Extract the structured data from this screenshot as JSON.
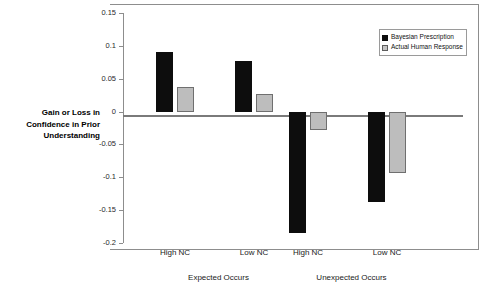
{
  "chart_data": {
    "type": "bar",
    "title": "",
    "subtitle": "",
    "xlabel": "",
    "ylabel": "Gain or Loss in Confidence in Prior Understanding",
    "ylim": [
      -0.2,
      0.15
    ],
    "ytick_labels": [
      "0.15",
      "0.1",
      "0.05",
      "0",
      "-0.05",
      "-0.1",
      "-0.15",
      "-0.2"
    ],
    "ytick_values": [
      0.15,
      0.1,
      0.05,
      0,
      -0.05,
      -0.1,
      -0.15,
      -0.2
    ],
    "grid": false,
    "legend_position": "top-right",
    "categories": [
      "High NC",
      "Low NC",
      "High NC",
      "Low NC"
    ],
    "group_labels": [
      "Expected Occurs",
      "Unexpected Occurs"
    ],
    "groups": [
      {
        "label": "Expected Occurs",
        "categories": [
          "High NC",
          "Low NC"
        ]
      },
      {
        "label": "Unexpected Occurs",
        "categories": [
          "High NC",
          "Low NC"
        ]
      }
    ],
    "series": [
      {
        "name": "Bayesian Prescription",
        "color": "#0d0d0d",
        "values": [
          0.09,
          0.077,
          -0.185,
          -0.137
        ]
      },
      {
        "name": "Actual Human Response",
        "color": "#bdbdbd",
        "values": [
          0.038,
          0.027,
          -0.028,
          -0.093
        ]
      }
    ]
  },
  "legend": {
    "items": [
      {
        "label": "Bayesian Prescription"
      },
      {
        "label": "Actual Human Response"
      }
    ]
  },
  "axis": {
    "y_title": "Gain or Loss in Confidence in Prior Understanding"
  }
}
